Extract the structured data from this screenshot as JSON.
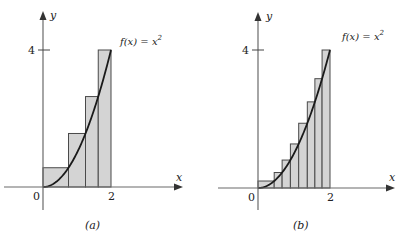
{
  "figure": {
    "panels": [
      {
        "id": "a",
        "caption": "(a)",
        "function_label": "f(x) = x",
        "function_exp": "2",
        "x_axis_label": "x",
        "y_axis_label": "y",
        "origin_label": "0",
        "x_tick_label": "2",
        "y_tick_label": "4"
      },
      {
        "id": "b",
        "caption": "(b)",
        "function_label": "f(x) = x",
        "function_exp": "2",
        "x_axis_label": "x",
        "y_axis_label": "y",
        "origin_label": "0",
        "x_tick_label": "2",
        "y_tick_label": "4"
      }
    ]
  },
  "chart_data": [
    {
      "type": "area",
      "title": "(a)",
      "function": "f(x) = x^2",
      "xlabel": "x",
      "ylabel": "y",
      "xlim": [
        0,
        2
      ],
      "ylim": [
        0,
        4
      ],
      "x_ticks": [
        2
      ],
      "y_ticks": [
        4
      ],
      "rectangles": {
        "method": "right-endpoint",
        "partition": [
          0,
          0.75,
          1.25,
          1.625,
          2
        ],
        "heights": [
          0.5625,
          1.5625,
          2.640625,
          4
        ]
      }
    },
    {
      "type": "area",
      "title": "(b)",
      "function": "f(x) = x^2",
      "xlabel": "x",
      "ylabel": "y",
      "xlim": [
        0,
        2
      ],
      "ylim": [
        0,
        4
      ],
      "x_ticks": [
        2
      ],
      "y_ticks": [
        4
      ],
      "rectangles": {
        "method": "right-endpoint",
        "partition": [
          0,
          0.45,
          0.67,
          0.9,
          1.13,
          1.37,
          1.58,
          1.78,
          2
        ],
        "heights": [
          0.2025,
          0.4489,
          0.81,
          1.2769,
          1.8769,
          2.4964,
          3.1684,
          4
        ]
      }
    }
  ]
}
